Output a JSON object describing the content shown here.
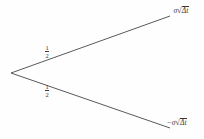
{
  "diagram": {
    "type": "binomial-one-step-tree",
    "background_color": "#fefefe",
    "line_color": "#5a5a5a",
    "text_color": "#3a3a3a",
    "width": 204,
    "height": 139,
    "root_node": {
      "label": "",
      "x": 11,
      "y": 73
    },
    "branches": [
      {
        "name": "up-branch",
        "probability_label": "1/2",
        "probability_numerator": "1",
        "probability_denominator": "2",
        "end_label": "σ√Δt",
        "end_sign": "",
        "end_coefficient": "σ",
        "end_radical_symbol": "√",
        "end_radicand": "Δt",
        "from_x": 11,
        "from_y": 73,
        "to_x": 170,
        "to_y": 16
      },
      {
        "name": "down-branch",
        "probability_label": "1/2",
        "probability_numerator": "1",
        "probability_denominator": "2",
        "end_label": "−σ√Δt",
        "end_sign": "−",
        "end_coefficient": "σ",
        "end_radical_symbol": "√",
        "end_radicand": "Δt",
        "from_x": 11,
        "from_y": 73,
        "to_x": 170,
        "to_y": 128
      }
    ]
  }
}
